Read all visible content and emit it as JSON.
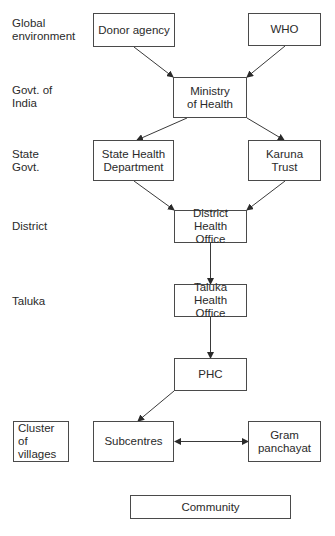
{
  "diagram": {
    "type": "organizational-flow",
    "levels": [
      {
        "id": "global",
        "lines": [
          "Global",
          "environment"
        ]
      },
      {
        "id": "india",
        "lines": [
          "Govt. of",
          "India"
        ]
      },
      {
        "id": "state",
        "lines": [
          "State",
          "Govt."
        ]
      },
      {
        "id": "district",
        "lines": [
          "District"
        ]
      },
      {
        "id": "taluka",
        "lines": [
          "Taluka"
        ]
      }
    ],
    "nodes": {
      "donor_agency": {
        "lines": [
          "Donor agency"
        ]
      },
      "who": {
        "lines": [
          "WHO"
        ]
      },
      "ministry": {
        "lines": [
          "Ministry",
          "of Health"
        ]
      },
      "state_health": {
        "lines": [
          "State Health",
          "Department"
        ]
      },
      "karuna": {
        "lines": [
          "Karuna",
          "Trust"
        ]
      },
      "dho": {
        "lines": [
          "District Health",
          "Office"
        ]
      },
      "tho": {
        "lines": [
          "Taluka Health",
          "Office"
        ]
      },
      "phc": {
        "lines": [
          "PHC"
        ]
      },
      "cluster": {
        "lines": [
          "Cluster of",
          "villages"
        ]
      },
      "subcentres": {
        "lines": [
          "Subcentres"
        ]
      },
      "gram": {
        "lines": [
          "Gram",
          "panchayat"
        ]
      },
      "community": {
        "lines": [
          "Community"
        ]
      }
    },
    "edges": [
      {
        "from": "Donor agency",
        "to": "Ministry of Health",
        "type": "arrow"
      },
      {
        "from": "WHO",
        "to": "Ministry of Health",
        "type": "arrow"
      },
      {
        "from": "Ministry of Health",
        "to": "State Health Department",
        "type": "arrow"
      },
      {
        "from": "Ministry of Health",
        "to": "Karuna Trust",
        "type": "arrow"
      },
      {
        "from": "State Health Department",
        "to": "District Health Office",
        "type": "arrow"
      },
      {
        "from": "Karuna Trust",
        "to": "District Health Office",
        "type": "arrow"
      },
      {
        "from": "District Health Office",
        "to": "Taluka Health Office",
        "type": "arrow"
      },
      {
        "from": "Taluka Health Office",
        "to": "PHC",
        "type": "arrow"
      },
      {
        "from": "PHC",
        "to": "Subcentres",
        "type": "arrow"
      },
      {
        "from": "Subcentres",
        "to": "Gram panchayat",
        "type": "bidirectional"
      }
    ],
    "colors": {
      "line": "#3a3a3a",
      "border": "#4a4a4a",
      "text": "#2a2a2a",
      "background": "#ffffff"
    }
  }
}
